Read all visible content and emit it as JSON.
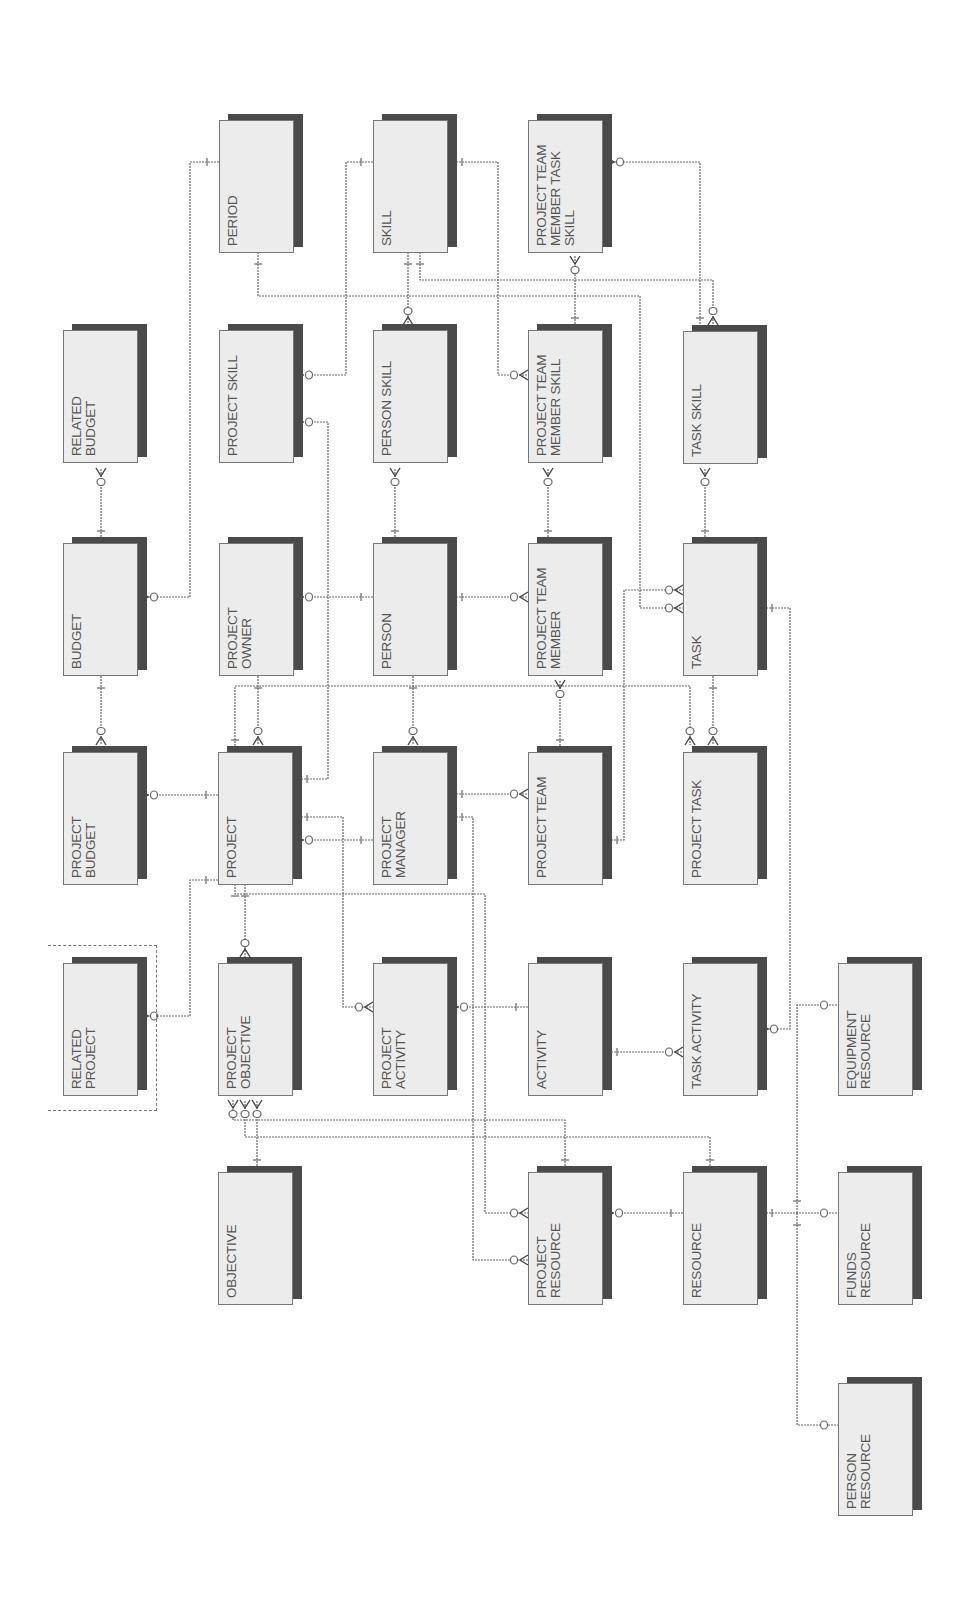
{
  "diagram": {
    "type": "entity-relationship",
    "orientation": "rotated-90",
    "colors": {
      "box_fill": "#ececec",
      "box_shadow": "#4a4a4a",
      "box_border": "#777777",
      "label": "#555555",
      "line": "#666666"
    },
    "entities": [
      {
        "id": "period",
        "label": "PERIOD",
        "x": 219,
        "y": 120
      },
      {
        "id": "skill",
        "label": "SKILL",
        "x": 373,
        "y": 120
      },
      {
        "id": "ptm_task_skill",
        "label": "PROJECT TEAM\nMEMBER TASK\nSKILL",
        "x": 528,
        "y": 120
      },
      {
        "id": "related_budget",
        "label": "RELATED\nBUDGET",
        "x": 63,
        "y": 330
      },
      {
        "id": "project_skill",
        "label": "PROJECT SKILL",
        "x": 219,
        "y": 330
      },
      {
        "id": "person_skill",
        "label": "PERSON SKILL",
        "x": 373,
        "y": 330
      },
      {
        "id": "ptm_skill",
        "label": "PROJECT TEAM\nMEMBER SKILL",
        "x": 528,
        "y": 330
      },
      {
        "id": "task_skill",
        "label": "TASK SKILL",
        "x": 683,
        "y": 331
      },
      {
        "id": "budget",
        "label": "BUDGET",
        "x": 63,
        "y": 543
      },
      {
        "id": "project_owner",
        "label": "PROJECT\nOWNER",
        "x": 219,
        "y": 543
      },
      {
        "id": "person",
        "label": "PERSON",
        "x": 373,
        "y": 543
      },
      {
        "id": "project_team_member",
        "label": "PROJECT TEAM\nMEMBER",
        "x": 528,
        "y": 543
      },
      {
        "id": "task",
        "label": "TASK",
        "x": 683,
        "y": 543
      },
      {
        "id": "project_budget",
        "label": "PROJECT\nBUDGET",
        "x": 63,
        "y": 752
      },
      {
        "id": "project",
        "label": "PROJECT",
        "x": 218,
        "y": 752
      },
      {
        "id": "project_manager",
        "label": "PROJECT\nMANAGER",
        "x": 373,
        "y": 752
      },
      {
        "id": "project_team",
        "label": "PROJECT TEAM",
        "x": 528,
        "y": 752
      },
      {
        "id": "project_task",
        "label": "PROJECT TASK",
        "x": 683,
        "y": 752
      },
      {
        "id": "related_project",
        "label": "RELATED\nPROJECT",
        "x": 63,
        "y": 963
      },
      {
        "id": "project_objective",
        "label": "PROJECT\nOBJECTIVE",
        "x": 218,
        "y": 963
      },
      {
        "id": "project_activity",
        "label": "PROJECT\nACTIVITY",
        "x": 373,
        "y": 963
      },
      {
        "id": "activity",
        "label": "ACTIVITY",
        "x": 528,
        "y": 963
      },
      {
        "id": "task_activity",
        "label": "TASK ACTIVITY",
        "x": 683,
        "y": 963
      },
      {
        "id": "equipment_resource",
        "label": "EQUIPMENT\nRESOURCE",
        "x": 838,
        "y": 963
      },
      {
        "id": "objective",
        "label": "OBJECTIVE",
        "x": 218,
        "y": 1172
      },
      {
        "id": "project_resource",
        "label": "PROJECT\nRESOURCE",
        "x": 528,
        "y": 1172
      },
      {
        "id": "resource",
        "label": "RESOURCE",
        "x": 683,
        "y": 1172
      },
      {
        "id": "funds_resource",
        "label": "FUNDS\nRESOURCE",
        "x": 838,
        "y": 1172
      },
      {
        "id": "person_resource",
        "label": "PERSON\nRESOURCE",
        "x": 838,
        "y": 1383
      }
    ],
    "relationships": [
      {
        "from": "budget",
        "to": "related_budget",
        "path": [
          [
            101,
            543
          ],
          [
            101,
            468
          ]
        ],
        "end_many": true
      },
      {
        "from": "period",
        "to": "budget",
        "path": [
          [
            219,
            162
          ],
          [
            190,
            162
          ],
          [
            190,
            597
          ],
          [
            140,
            597
          ]
        ],
        "end_many": true
      },
      {
        "from": "budget",
        "to": "project_budget",
        "path": [
          [
            101,
            676
          ],
          [
            101,
            745
          ]
        ],
        "end_many": true
      },
      {
        "from": "project",
        "to": "project_budget",
        "path": [
          [
            218,
            795
          ],
          [
            140,
            795
          ]
        ],
        "end_many": true
      },
      {
        "from": "project_owner",
        "to": "project",
        "path": [
          [
            258,
            676
          ],
          [
            258,
            745
          ]
        ],
        "end_many": true
      },
      {
        "from": "person",
        "to": "project_owner",
        "path": [
          [
            373,
            597
          ],
          [
            295,
            597
          ]
        ],
        "end_many": true
      },
      {
        "from": "skill",
        "to": "project_skill",
        "path": [
          [
            373,
            162
          ],
          [
            346,
            162
          ],
          [
            346,
            375
          ],
          [
            295,
            375
          ]
        ],
        "end_many": true
      },
      {
        "from": "project",
        "to": "project_skill",
        "path": [
          [
            295,
            779
          ],
          [
            328,
            779
          ],
          [
            328,
            422
          ],
          [
            295,
            422
          ]
        ],
        "end_many": true
      },
      {
        "from": "period",
        "to": "task",
        "path": [
          [
            258,
            252
          ],
          [
            258,
            296
          ],
          [
            640,
            296
          ],
          [
            640,
            608
          ],
          [
            683,
            608
          ]
        ],
        "end_many": true
      },
      {
        "from": "skill",
        "to": "person_skill",
        "path": [
          [
            408,
            252
          ],
          [
            408,
            325
          ]
        ],
        "end_many": true
      },
      {
        "from": "person",
        "to": "person_skill",
        "path": [
          [
            395,
            543
          ],
          [
            395,
            468
          ]
        ],
        "end_many": true
      },
      {
        "from": "skill",
        "to": "ptm_skill",
        "path": [
          [
            450,
            162
          ],
          [
            498,
            162
          ],
          [
            498,
            375
          ],
          [
            528,
            375
          ]
        ],
        "end_many": true
      },
      {
        "from": "skill",
        "to": "task_skill",
        "path": [
          [
            420,
            252
          ],
          [
            420,
            280
          ],
          [
            713,
            280
          ],
          [
            713,
            325
          ]
        ],
        "end_many": true
      },
      {
        "from": "ptm_skill",
        "to": "ptm_task_skill",
        "path": [
          [
            575,
            330
          ],
          [
            575,
            256
          ]
        ],
        "end_many": true
      },
      {
        "from": "task_skill",
        "to": "ptm_task_skill",
        "path": [
          [
            700,
            330
          ],
          [
            700,
            162
          ],
          [
            606,
            162
          ]
        ],
        "end_many": true
      },
      {
        "from": "project_team_member",
        "to": "ptm_skill",
        "path": [
          [
            548,
            543
          ],
          [
            548,
            468
          ]
        ],
        "end_many": true
      },
      {
        "from": "person",
        "to": "project_team_member",
        "path": [
          [
            450,
            597
          ],
          [
            528,
            597
          ]
        ],
        "end_many": true
      },
      {
        "from": "project_team",
        "to": "project_team_member",
        "path": [
          [
            560,
            752
          ],
          [
            560,
            680
          ]
        ],
        "end_many": true
      },
      {
        "from": "task",
        "to": "task_skill",
        "path": [
          [
            705,
            543
          ],
          [
            705,
            468
          ]
        ],
        "end_many": true
      },
      {
        "from": "person",
        "to": "project_manager",
        "path": [
          [
            413,
            676
          ],
          [
            413,
            745
          ]
        ],
        "end_many": true
      },
      {
        "from": "project_manager",
        "to": "project",
        "path": [
          [
            373,
            840
          ],
          [
            295,
            840
          ]
        ],
        "end_many": true
      },
      {
        "from": "project_manager",
        "to": "project_team",
        "path": [
          [
            450,
            794
          ],
          [
            528,
            794
          ]
        ],
        "end_many": true
      },
      {
        "from": "project_team",
        "to": "task",
        "path": [
          [
            605,
            840
          ],
          [
            624,
            840
          ],
          [
            624,
            590
          ],
          [
            683,
            590
          ]
        ],
        "end_many": true
      },
      {
        "from": "project",
        "to": "project_task",
        "path": [
          [
            235,
            752
          ],
          [
            235,
            686
          ],
          [
            690,
            686
          ],
          [
            690,
            745
          ]
        ],
        "end_many": true
      },
      {
        "from": "task",
        "to": "project_task",
        "path": [
          [
            713,
            676
          ],
          [
            713,
            745
          ]
        ],
        "end_many": true
      },
      {
        "from": "project",
        "to": "related_project",
        "path": [
          [
            218,
            880
          ],
          [
            190,
            880
          ],
          [
            190,
            1016
          ],
          [
            140,
            1016
          ]
        ],
        "end_many": true
      },
      {
        "from": "project",
        "to": "project_objective",
        "path": [
          [
            245,
            884
          ],
          [
            245,
            957
          ]
        ],
        "end_many": true
      },
      {
        "from": "project",
        "to": "project_activity",
        "path": [
          [
            295,
            817
          ],
          [
            343,
            817
          ],
          [
            343,
            1007
          ],
          [
            373,
            1007
          ]
        ],
        "end_many": true
      },
      {
        "from": "activity",
        "to": "project_activity",
        "path": [
          [
            528,
            1007
          ],
          [
            450,
            1007
          ]
        ],
        "end_many": true
      },
      {
        "from": "activity",
        "to": "task_activity",
        "path": [
          [
            605,
            1052
          ],
          [
            683,
            1052
          ]
        ],
        "end_many": true
      },
      {
        "from": "task",
        "to": "task_activity",
        "path": [
          [
            760,
            608
          ],
          [
            790,
            608
          ],
          [
            790,
            1029
          ],
          [
            760,
            1029
          ]
        ],
        "end_many": true
      },
      {
        "from": "project",
        "to": "project_resource",
        "path": [
          [
            235,
            884
          ],
          [
            235,
            894
          ],
          [
            485,
            894
          ],
          [
            485,
            1213
          ],
          [
            528,
            1213
          ]
        ],
        "end_many": true
      },
      {
        "from": "project_manager",
        "to": "project_resource",
        "path": [
          [
            450,
            817
          ],
          [
            473,
            817
          ],
          [
            473,
            1260
          ],
          [
            528,
            1260
          ]
        ],
        "end_many": true
      },
      {
        "from": "objective",
        "to": "project_objective",
        "path": [
          [
            257,
            1172
          ],
          [
            257,
            1100
          ]
        ],
        "end_many": true
      },
      {
        "from": "project_resource",
        "to": "project_objective",
        "path": [
          [
            565,
            1172
          ],
          [
            565,
            1120
          ],
          [
            233,
            1120
          ],
          [
            233,
            1100
          ]
        ],
        "end_many": true
      },
      {
        "from": "resource",
        "to": "project_objective",
        "path": [
          [
            710,
            1172
          ],
          [
            710,
            1137
          ],
          [
            245,
            1137
          ],
          [
            245,
            1100
          ]
        ],
        "end_many": true
      },
      {
        "from": "resource",
        "to": "project_resource",
        "path": [
          [
            683,
            1213
          ],
          [
            605,
            1213
          ]
        ],
        "end_many": true
      },
      {
        "from": "resource",
        "to": "funds_resource",
        "path": [
          [
            760,
            1213
          ],
          [
            838,
            1213
          ]
        ],
        "end_many": false
      },
      {
        "from": "resource",
        "to": "equipment_resource",
        "path": [
          [
            797,
            1213
          ],
          [
            797,
            1005
          ],
          [
            838,
            1005
          ]
        ],
        "end_many": false
      },
      {
        "from": "resource",
        "to": "person_resource",
        "path": [
          [
            797,
            1213
          ],
          [
            797,
            1425
          ],
          [
            838,
            1425
          ]
        ],
        "end_many": false
      }
    ]
  }
}
